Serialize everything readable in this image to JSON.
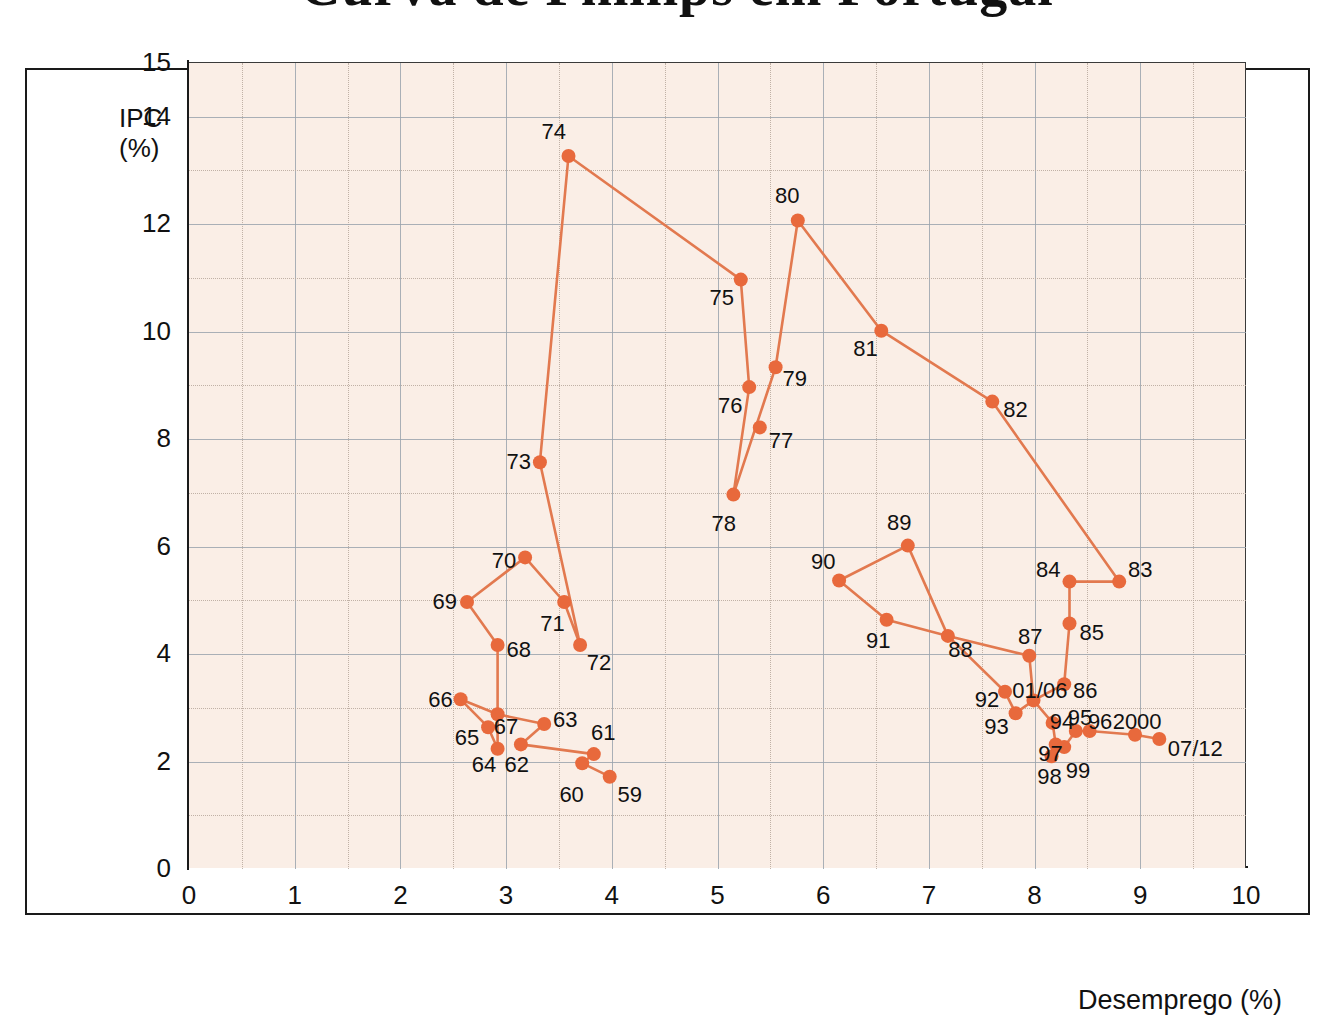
{
  "title": "Curva de Phillips em Portugal",
  "axes": {
    "y_label_line1": "IPC",
    "y_label_line2": "(%)",
    "x_label": "Desemprego (%)",
    "y_ticks": [
      "0",
      "2",
      "4",
      "6",
      "8",
      "10",
      "12",
      "14",
      "15"
    ],
    "x_ticks": [
      "0",
      "1",
      "2",
      "3",
      "4",
      "5",
      "6",
      "7",
      "8",
      "9",
      "10"
    ]
  },
  "style": {
    "marker_color": "#e8693c",
    "line_color": "#e2794f",
    "plot_background": "#faeee6",
    "grid_color": "#9aa3ad",
    "frame_color": "#1a1a1a"
  },
  "chart_data": {
    "type": "scatter",
    "title": "Curva de Phillips em Portugal",
    "xlabel": "Desemprego (%)",
    "ylabel": "IPC (%)",
    "xlim": [
      0,
      10
    ],
    "ylim": [
      0,
      15
    ],
    "grid": true,
    "connected": true,
    "legend": "none",
    "points": [
      {
        "label": "59",
        "x": 3.98,
        "y": 1.7,
        "lx": 4.17,
        "ly": 1.35
      },
      {
        "label": "60",
        "x": 3.72,
        "y": 1.95,
        "lx": 3.62,
        "ly": 1.35
      },
      {
        "label": "61",
        "x": 3.83,
        "y": 2.12,
        "lx": 3.92,
        "ly": 2.52
      },
      {
        "label": "62",
        "x": 3.14,
        "y": 2.3,
        "lx": 3.1,
        "ly": 1.92
      },
      {
        "label": "63",
        "x": 3.36,
        "y": 2.68,
        "lx": 3.56,
        "ly": 2.75
      },
      {
        "label": "64",
        "x": 2.92,
        "y": 2.22,
        "lx": 2.79,
        "ly": 1.92
      },
      {
        "label": "65",
        "x": 2.83,
        "y": 2.62,
        "lx": 2.63,
        "ly": 2.42
      },
      {
        "label": "66",
        "x": 2.57,
        "y": 3.14,
        "lx": 2.38,
        "ly": 3.12
      },
      {
        "label": "67",
        "x": 2.92,
        "y": 2.86,
        "lx": 3.0,
        "ly": 2.62
      },
      {
        "label": "68",
        "x": 2.92,
        "y": 4.15,
        "lx": 3.12,
        "ly": 4.05
      },
      {
        "label": "69",
        "x": 2.63,
        "y": 4.95,
        "lx": 2.42,
        "ly": 4.95
      },
      {
        "label": "70",
        "x": 3.18,
        "y": 5.78,
        "lx": 2.98,
        "ly": 5.72
      },
      {
        "label": "71",
        "x": 3.55,
        "y": 4.95,
        "lx": 3.44,
        "ly": 4.55
      },
      {
        "label": "72",
        "x": 3.7,
        "y": 4.15,
        "lx": 3.88,
        "ly": 3.82
      },
      {
        "label": "73",
        "x": 3.32,
        "y": 7.55,
        "lx": 3.12,
        "ly": 7.55
      },
      {
        "label": "74",
        "x": 3.59,
        "y": 13.25,
        "lx": 3.45,
        "ly": 13.7
      },
      {
        "label": "75",
        "x": 5.22,
        "y": 10.95,
        "lx": 5.04,
        "ly": 10.6
      },
      {
        "label": "76",
        "x": 5.3,
        "y": 8.95,
        "lx": 5.12,
        "ly": 8.6
      },
      {
        "label": "77",
        "x": 5.4,
        "y": 8.2,
        "lx": 5.6,
        "ly": 7.95
      },
      {
        "label": "78",
        "x": 5.15,
        "y": 6.95,
        "lx": 5.06,
        "ly": 6.4
      },
      {
        "label": "79",
        "x": 5.55,
        "y": 9.32,
        "lx": 5.73,
        "ly": 9.1
      },
      {
        "label": "80",
        "x": 5.76,
        "y": 12.05,
        "lx": 5.66,
        "ly": 12.5
      },
      {
        "label": "81",
        "x": 6.55,
        "y": 10.0,
        "lx": 6.4,
        "ly": 9.65
      },
      {
        "label": "82",
        "x": 7.6,
        "y": 8.68,
        "lx": 7.82,
        "ly": 8.52
      },
      {
        "label": "83",
        "x": 8.8,
        "y": 5.33,
        "lx": 9.0,
        "ly": 5.55
      },
      {
        "label": "84",
        "x": 8.33,
        "y": 5.33,
        "lx": 8.13,
        "ly": 5.55
      },
      {
        "label": "85",
        "x": 8.33,
        "y": 4.55,
        "lx": 8.54,
        "ly": 4.38
      },
      {
        "label": "86",
        "x": 8.28,
        "y": 3.42,
        "lx": 8.48,
        "ly": 3.3
      },
      {
        "label": "87",
        "x": 7.95,
        "y": 3.95,
        "lx": 7.96,
        "ly": 4.3
      },
      {
        "label": "88",
        "x": 7.18,
        "y": 4.32,
        "lx": 7.3,
        "ly": 4.06
      },
      {
        "label": "89",
        "x": 6.8,
        "y": 6.0,
        "lx": 6.72,
        "ly": 6.42
      },
      {
        "label": "90",
        "x": 6.15,
        "y": 5.35,
        "lx": 6.0,
        "ly": 5.7
      },
      {
        "label": "91",
        "x": 6.6,
        "y": 4.62,
        "lx": 6.52,
        "ly": 4.22
      },
      {
        "label": "92",
        "x": 7.72,
        "y": 3.28,
        "lx": 7.55,
        "ly": 3.12
      },
      {
        "label": "93",
        "x": 7.82,
        "y": 2.88,
        "lx": 7.64,
        "ly": 2.62
      },
      {
        "label": "01/06",
        "x": 7.99,
        "y": 3.12,
        "lx": 8.05,
        "ly": 3.3
      },
      {
        "label": "94",
        "x": 8.17,
        "y": 2.7,
        "lx": 8.26,
        "ly": 2.72
      },
      {
        "label": "95",
        "x": 8.39,
        "y": 2.55,
        "lx": 8.43,
        "ly": 2.8
      },
      {
        "label": "96",
        "x": 8.52,
        "y": 2.55,
        "lx": 8.62,
        "ly": 2.72
      },
      {
        "label": "97",
        "x": 8.2,
        "y": 2.3,
        "lx": 8.15,
        "ly": 2.12
      },
      {
        "label": "98",
        "x": 8.16,
        "y": 2.08,
        "lx": 8.14,
        "ly": 1.7
      },
      {
        "label": "99",
        "x": 8.28,
        "y": 2.25,
        "lx": 8.41,
        "ly": 1.8
      },
      {
        "label": "2000",
        "x": 8.95,
        "y": 2.48,
        "lx": 8.97,
        "ly": 2.72
      },
      {
        "label": "07/12",
        "x": 9.18,
        "y": 2.4,
        "lx": 9.52,
        "ly": 2.22
      }
    ],
    "path_order": [
      "59",
      "60",
      "61",
      "62",
      "63",
      "67",
      "64",
      "65",
      "66",
      "67",
      "68",
      "69",
      "70",
      "71",
      "72",
      "73",
      "74",
      "75",
      "76",
      "78",
      "79",
      "80",
      "81",
      "82",
      "83",
      "84",
      "85",
      "86",
      "01/06",
      "87",
      "88",
      "89",
      "90",
      "91",
      "88",
      "92",
      "93",
      "01/06",
      "94",
      "97",
      "98",
      "99",
      "95",
      "96",
      "2000",
      "07/12"
    ]
  }
}
